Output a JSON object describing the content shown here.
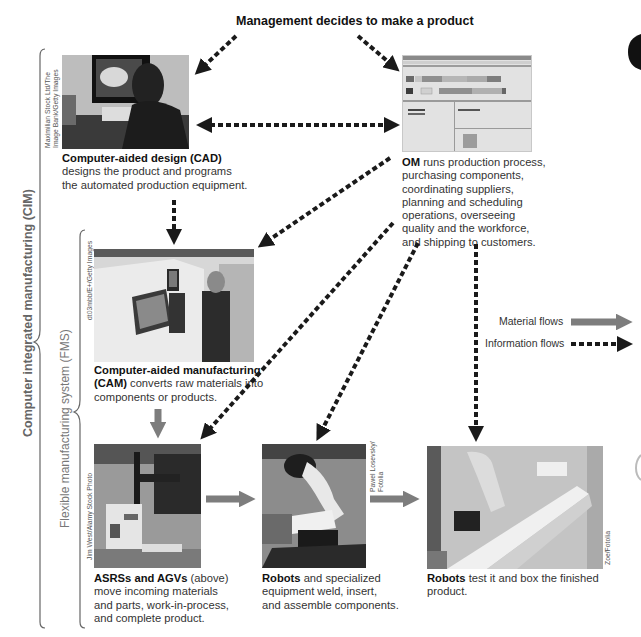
{
  "title": "Management decides to make a product",
  "brackets": {
    "cim_label": "Computer integrated manufacturing (CIM)",
    "fms_label": "Flexible manufacturing system (FMS)"
  },
  "nodes": {
    "cad": {
      "bold": "Computer-aided design (CAD)",
      "lines": [
        "designs the product and programs",
        "the automated production equipment."
      ],
      "credit": [
        "Maximilian Stock Ltd/The",
        "Image Bank/Getty Images"
      ]
    },
    "om": {
      "bold": "OM",
      "first_line_rest": " runs production process,",
      "lines": [
        "purchasing components,",
        "coordinating suppliers,",
        "planning and scheduling",
        "operations, overseeing",
        "quality and the workforce,",
        "and shipping to customers."
      ]
    },
    "cam": {
      "bold_line1": "Computer-aided manufacturing",
      "bold_line2": "(CAM)",
      "line2_rest": " converts raw materials into",
      "lines": [
        "components or products."
      ],
      "credit": "dt03mbb/E+/Getty Images"
    },
    "asrs": {
      "bold": "ASRSs and AGVs",
      "first_line_rest": " (above)",
      "lines": [
        "move incoming materials",
        "and parts, work-in-process,",
        "and complete product."
      ],
      "credit": "Jim West/Alamy Stock Photo"
    },
    "robots_assemble": {
      "bold": "Robots",
      "first_line_rest": " and specialized",
      "lines": [
        "equipment weld, insert,",
        "and assemble components."
      ],
      "credit": [
        "Pawel Losevsky/",
        "Fotolia"
      ]
    },
    "robots_test": {
      "bold": "Robots",
      "first_line_rest": " test it and box the finished",
      "lines": [
        "product."
      ],
      "credit": "Zoe/Fotolia"
    }
  },
  "legend": {
    "material": "Material flows",
    "information": "Information flows"
  },
  "colors": {
    "material_arrow": "#7d7d7d",
    "info_arrow": "#1a1a1a",
    "bracket": "#666666",
    "text": "#333333"
  }
}
